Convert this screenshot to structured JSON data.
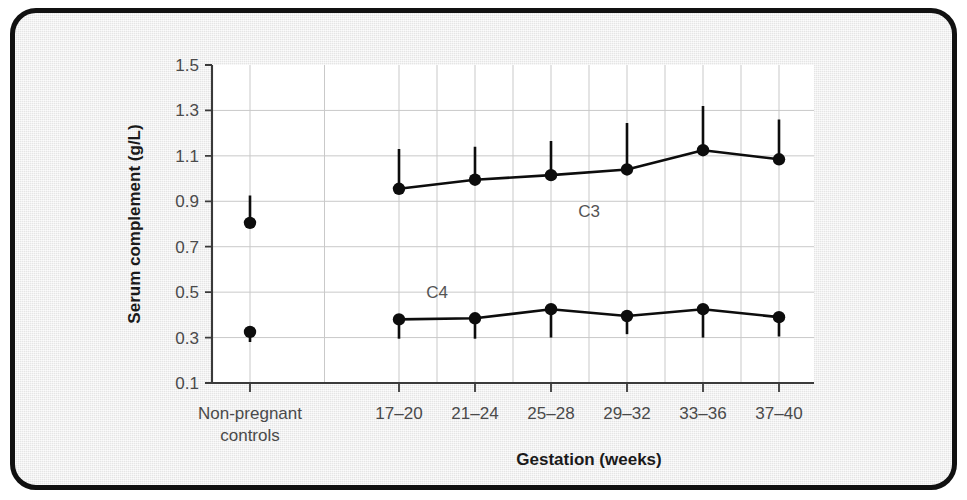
{
  "figure": {
    "frame_border_color": "#111111",
    "background_color": "#ececec",
    "plot_background_color": "#ffffff",
    "ink_color": "#0d0d0d",
    "grid_color": "#c9c9c9"
  },
  "chart_data": {
    "type": "line",
    "title": "",
    "subtitle": "",
    "xlabel": "Gestation (weeks)",
    "ylabel": "Serum complement (g/L)",
    "ylim": [
      0.1,
      1.5
    ],
    "yticks": [
      0.1,
      0.3,
      0.5,
      0.7,
      0.9,
      1.1,
      1.3,
      1.5
    ],
    "ytick_labels": [
      "0.1",
      "0.3",
      "0.5",
      "0.7",
      "0.9",
      "1.1",
      "1.3",
      "1.5"
    ],
    "categories": [
      "Non-pregnant controls",
      "17–20",
      "21–24",
      "25–28",
      "29–32",
      "33–36",
      "37–40"
    ],
    "xtick_labels": [
      [
        "Non-pregnant",
        "controls"
      ],
      [
        "17–20"
      ],
      [
        "21–24"
      ],
      [
        "25–28"
      ],
      [
        "29–32"
      ],
      [
        "33–36"
      ],
      [
        "37–40"
      ]
    ],
    "grid": "horizontal-and-vertical",
    "legend": "inline-annotations",
    "annotations": [
      {
        "text": "C3",
        "x_category": "25–28",
        "value": 0.945,
        "x_offset": 38,
        "y_offset": 26
      },
      {
        "text": "C4",
        "x_category": "17–20",
        "value": 0.455,
        "x_offset": 38,
        "y_offset": -4
      }
    ],
    "series": [
      {
        "name": "C3",
        "label": "C3",
        "connected_from_index": 1,
        "points": [
          {
            "category": "Non-pregnant controls",
            "value": 0.805,
            "err_high": 0.925,
            "err_low": 0.805
          },
          {
            "category": "17–20",
            "value": 0.955,
            "err_high": 1.13,
            "err_low": 0.955
          },
          {
            "category": "21–24",
            "value": 0.995,
            "err_high": 1.14,
            "err_low": 0.995
          },
          {
            "category": "25–28",
            "value": 1.015,
            "err_high": 1.165,
            "err_low": 1.015
          },
          {
            "category": "29–32",
            "value": 1.04,
            "err_high": 1.245,
            "err_low": 1.04
          },
          {
            "category": "33–36",
            "value": 1.125,
            "err_high": 1.32,
            "err_low": 1.125
          },
          {
            "category": "37–40",
            "value": 1.085,
            "err_high": 1.26,
            "err_low": 1.085
          }
        ]
      },
      {
        "name": "C4",
        "label": "C4",
        "connected_from_index": 1,
        "points": [
          {
            "category": "Non-pregnant controls",
            "value": 0.325,
            "err_high": 0.325,
            "err_low": 0.28
          },
          {
            "category": "17–20",
            "value": 0.38,
            "err_high": 0.38,
            "err_low": 0.295
          },
          {
            "category": "21–24",
            "value": 0.385,
            "err_high": 0.385,
            "err_low": 0.295
          },
          {
            "category": "25–28",
            "value": 0.425,
            "err_high": 0.425,
            "err_low": 0.3
          },
          {
            "category": "29–32",
            "value": 0.395,
            "err_high": 0.395,
            "err_low": 0.315
          },
          {
            "category": "33–36",
            "value": 0.425,
            "err_high": 0.425,
            "err_low": 0.3
          },
          {
            "category": "37–40",
            "value": 0.39,
            "err_high": 0.39,
            "err_low": 0.305
          }
        ]
      }
    ]
  },
  "geometry": {
    "plot_left": 207,
    "plot_right": 809,
    "plot_top": 60,
    "plot_bottom": 378,
    "x_positions": [
      245,
      394,
      470,
      546,
      622,
      698,
      774
    ],
    "marker_radius": 6.2
  }
}
